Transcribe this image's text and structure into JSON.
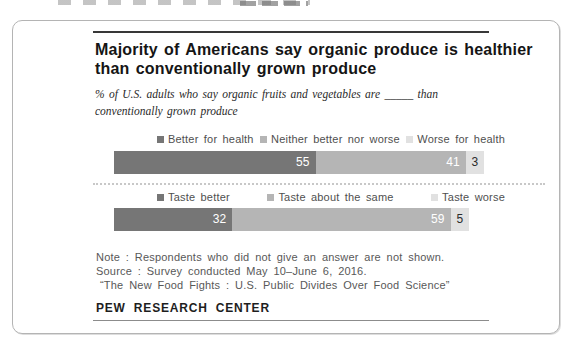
{
  "header": {
    "title_line1": "Majority of Americans say organic produce is healthier",
    "title_line2": "than conventionally grown produce",
    "subtitle_line1": "% of U.S. adults who say organic fruits and vegetables are _____ than",
    "subtitle_line2": "conventionally grown produce"
  },
  "chart_data": {
    "type": "bar",
    "orientation": "horizontal-stacked",
    "unit": "% of U.S. adults",
    "xlim": [
      0,
      100
    ],
    "axes_hidden": true,
    "legend_position": "top",
    "title": "Majority of Americans say organic produce is healthier than conventionally grown produce",
    "subtitle": "% of U.S. adults who say organic fruits and vegetables are _____ than conventionally grown produce",
    "rows": [
      {
        "segments": [
          {
            "label": "Better for health",
            "value": 55,
            "color": "#767676",
            "text_color": "#ffffff"
          },
          {
            "label": "Neither better nor worse",
            "value": 41,
            "color": "#b5b5b5",
            "text_color": "#ffffff"
          },
          {
            "label": "Worse for health",
            "value": 3,
            "color": "#e1e1e1",
            "text_color": "#2b2b2b"
          }
        ]
      },
      {
        "segments": [
          {
            "label": "Taste better",
            "value": 32,
            "color": "#767676",
            "text_color": "#ffffff"
          },
          {
            "label": "Taste about the same",
            "value": 59,
            "color": "#b5b5b5",
            "text_color": "#ffffff"
          },
          {
            "label": "Taste worse",
            "value": 5,
            "color": "#e1e1e1",
            "text_color": "#2b2b2b"
          }
        ]
      }
    ]
  },
  "notes": {
    "line1": "Note : Respondents who did not give an answer are not shown.",
    "line2": "Source : Survey conducted May 10–June 6, 2016.",
    "line3": "“The New Food Fights : U.S. Public Divides Over Food Science”"
  },
  "footer": {
    "brand": "PEW RESEARCH CENTER"
  }
}
